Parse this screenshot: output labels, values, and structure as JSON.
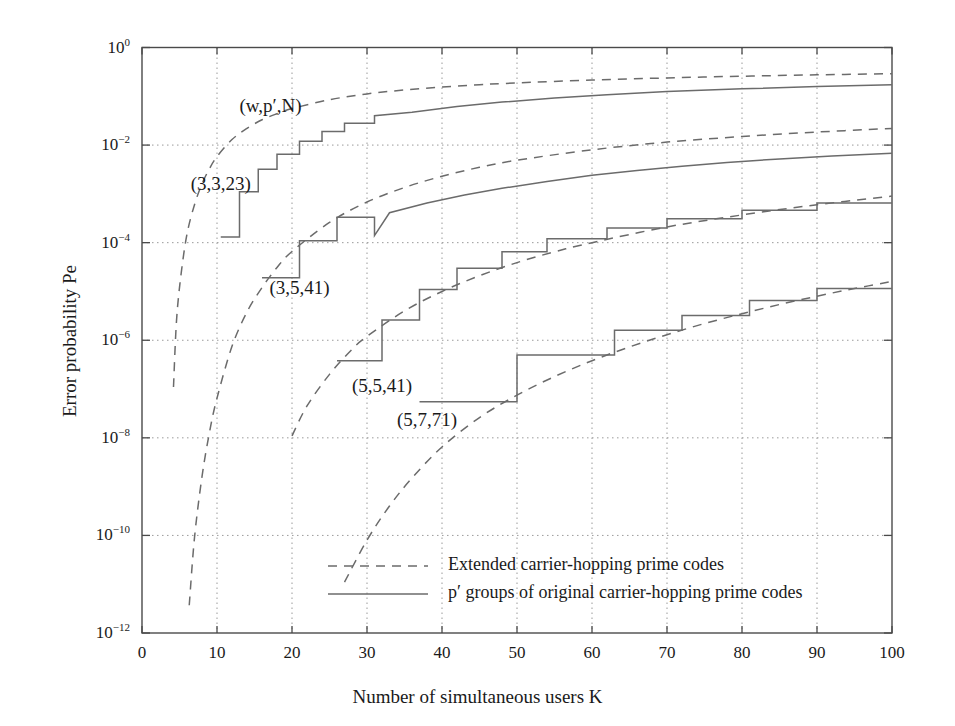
{
  "chart_data": {
    "type": "line",
    "title": "",
    "xlabel": "Number of simultaneous users K",
    "ylabel": "Error probability Pe",
    "xlim": [
      0,
      100
    ],
    "ylim": [
      1e-12,
      1
    ],
    "yscale": "log",
    "xscale": "linear",
    "grid": true,
    "xticks": [
      "0",
      "10",
      "20",
      "30",
      "40",
      "50",
      "60",
      "70",
      "80",
      "90",
      "100"
    ],
    "yticks": [
      "10⁰",
      "10⁻²",
      "10⁻⁴",
      "10⁻⁶",
      "10⁻⁸",
      "10⁻¹⁰",
      "10⁻¹²"
    ],
    "ytick_exponents": [
      "0",
      "-2",
      "-4",
      "-6",
      "-8",
      "-10",
      "-12"
    ],
    "parameter_legend": "(w,p′,N)",
    "legend_position": "lower-center-inside",
    "legend": [
      {
        "label": "Extended carrier-hopping prime codes",
        "style": "dashed"
      },
      {
        "label": "p′ groups of original carrier-hopping prime codes",
        "style": "solid"
      }
    ],
    "annotations": [
      {
        "text": "(w,p′,N)",
        "x": 13,
        "y": 0.06
      },
      {
        "text": "(3,3,23)",
        "x": 6.5,
        "y": 0.0015
      },
      {
        "text": "(3,5,41)",
        "x": 17,
        "y": 1.1e-05
      },
      {
        "text": "(5,5,41)",
        "x": 28,
        "y": 1.1e-07
      },
      {
        "text": "(5,7,71)",
        "x": 34,
        "y": 2.2e-08
      }
    ],
    "series": [
      {
        "name": "(3,3,23) extended",
        "style": "dashed",
        "params": {
          "w": 3,
          "p_prime": 3,
          "N": 23
        },
        "points": [
          [
            4.2,
            1.1e-07
          ],
          [
            4.6,
            2.5e-06
          ],
          [
            5.2,
            2.2e-05
          ],
          [
            6.0,
            0.00015
          ],
          [
            7.0,
            0.0006
          ],
          [
            8.0,
            0.0016
          ],
          [
            9.0,
            0.0033
          ],
          [
            10.0,
            0.0058
          ],
          [
            12.0,
            0.013
          ],
          [
            14.0,
            0.022
          ],
          [
            16.0,
            0.033
          ],
          [
            18.0,
            0.044
          ],
          [
            20.0,
            0.056
          ],
          [
            25.0,
            0.085
          ],
          [
            30.0,
            0.112
          ],
          [
            35.0,
            0.135
          ],
          [
            40.0,
            0.155
          ],
          [
            45.0,
            0.173
          ],
          [
            50.0,
            0.188
          ],
          [
            60.0,
            0.215
          ],
          [
            70.0,
            0.238
          ],
          [
            80.0,
            0.258
          ],
          [
            90.0,
            0.275
          ],
          [
            100.0,
            0.29
          ]
        ]
      },
      {
        "name": "(3,3,23) p′ groups",
        "style": "solid-step",
        "params": {
          "w": 3,
          "p_prime": 3,
          "N": 23
        },
        "points": [
          [
            10.5,
            0.00013
          ],
          [
            13.0,
            0.00013
          ],
          [
            13.0,
            0.0011
          ],
          [
            15.5,
            0.0011
          ],
          [
            15.5,
            0.0032
          ],
          [
            18.0,
            0.0032
          ],
          [
            18.0,
            0.0065
          ],
          [
            21.0,
            0.0065
          ],
          [
            21.0,
            0.012
          ],
          [
            24.0,
            0.012
          ],
          [
            24.0,
            0.019
          ],
          [
            27.0,
            0.019
          ],
          [
            27.0,
            0.028
          ],
          [
            31.0,
            0.028
          ],
          [
            31.0,
            0.04
          ],
          [
            36.0,
            0.047
          ],
          [
            42.0,
            0.062
          ],
          [
            48.0,
            0.076
          ],
          [
            55.0,
            0.092
          ],
          [
            62.0,
            0.108
          ],
          [
            70.0,
            0.125
          ],
          [
            80.0,
            0.142
          ],
          [
            90.0,
            0.158
          ],
          [
            100.0,
            0.172
          ]
        ]
      },
      {
        "name": "(3,5,41) extended",
        "style": "dashed",
        "params": {
          "w": 3,
          "p_prime": 5,
          "N": 41
        },
        "points": [
          [
            6.3,
            3.7e-12
          ],
          [
            7.0,
            9e-11
          ],
          [
            8.0,
            1.6e-09
          ],
          [
            9.0,
            1.3e-08
          ],
          [
            10.0,
            6.5e-08
          ],
          [
            12.0,
            7.5e-07
          ],
          [
            14.0,
            3.8e-06
          ],
          [
            16.0,
            1.2e-05
          ],
          [
            18.0,
            3.1e-05
          ],
          [
            20.0,
            6.6e-05
          ],
          [
            25.0,
            0.00026
          ],
          [
            30.0,
            0.00068
          ],
          [
            35.0,
            0.00135
          ],
          [
            40.0,
            0.0023
          ],
          [
            45.0,
            0.0035
          ],
          [
            50.0,
            0.0049
          ],
          [
            60.0,
            0.008
          ],
          [
            70.0,
            0.0115
          ],
          [
            80.0,
            0.015
          ],
          [
            90.0,
            0.0185
          ],
          [
            100.0,
            0.022
          ]
        ]
      },
      {
        "name": "(3,5,41) p′ groups",
        "style": "solid-step",
        "params": {
          "w": 3,
          "p_prime": 5,
          "N": 41
        },
        "points": [
          [
            16.0,
            1.9e-05
          ],
          [
            21.0,
            1.9e-05
          ],
          [
            21.0,
            0.00011
          ],
          [
            26.0,
            0.00011
          ],
          [
            26.0,
            0.00033
          ],
          [
            31.0,
            0.00033
          ],
          [
            31.0,
            0.00014
          ],
          [
            33.0,
            0.00041
          ],
          [
            38.0,
            0.00065
          ],
          [
            43.0,
            0.00095
          ],
          [
            48.0,
            0.0013
          ],
          [
            54.0,
            0.0018
          ],
          [
            60.0,
            0.0024
          ],
          [
            66.0,
            0.003
          ],
          [
            72.0,
            0.0037
          ],
          [
            78.0,
            0.0044
          ],
          [
            85.0,
            0.0052
          ],
          [
            92.0,
            0.006
          ],
          [
            100.0,
            0.0068
          ]
        ]
      },
      {
        "name": "(5,5,41) extended",
        "style": "dashed",
        "params": {
          "w": 5,
          "p_prime": 5,
          "N": 41
        },
        "points": [
          [
            20.0,
            1.1e-08
          ],
          [
            22.0,
            4.5e-08
          ],
          [
            25.0,
            2e-07
          ],
          [
            28.0,
            6.5e-07
          ],
          [
            30.0,
            1.2e-06
          ],
          [
            35.0,
            4e-06
          ],
          [
            40.0,
            1e-05
          ],
          [
            45.0,
            2.1e-05
          ],
          [
            50.0,
            3.9e-05
          ],
          [
            55.0,
            6.5e-05
          ],
          [
            60.0,
            0.0001
          ],
          [
            70.0,
            0.00021
          ],
          [
            80.0,
            0.00037
          ],
          [
            90.0,
            0.0006
          ],
          [
            100.0,
            0.0009
          ]
        ]
      },
      {
        "name": "(5,5,41) p′ groups",
        "style": "solid-step",
        "params": {
          "w": 5,
          "p_prime": 5,
          "N": 41
        },
        "points": [
          [
            26.0,
            3.8e-07
          ],
          [
            32.0,
            3.8e-07
          ],
          [
            32.0,
            2.6e-06
          ],
          [
            37.0,
            2.6e-06
          ],
          [
            37.0,
            1.1e-05
          ],
          [
            42.0,
            1.1e-05
          ],
          [
            42.0,
            3e-05
          ],
          [
            48.0,
            3e-05
          ],
          [
            48.0,
            6.5e-05
          ],
          [
            54.0,
            6.5e-05
          ],
          [
            54.0,
            0.00012
          ],
          [
            62.0,
            0.00012
          ],
          [
            62.0,
            0.0002
          ],
          [
            70.0,
            0.0002
          ],
          [
            70.0,
            0.00031
          ],
          [
            80.0,
            0.00031
          ],
          [
            80.0,
            0.00046
          ],
          [
            90.0,
            0.00046
          ],
          [
            90.0,
            0.00065
          ],
          [
            100.0,
            0.00065
          ]
        ]
      },
      {
        "name": "(5,7,71) extended",
        "style": "dashed",
        "params": {
          "w": 5,
          "p_prime": 7,
          "N": 71
        },
        "points": [
          [
            27.0,
            1.1e-11
          ],
          [
            30.0,
            8e-11
          ],
          [
            33.0,
            4e-10
          ],
          [
            36.0,
            1.5e-09
          ],
          [
            40.0,
            6.5e-09
          ],
          [
            45.0,
            2.6e-08
          ],
          [
            50.0,
            7.5e-08
          ],
          [
            55.0,
            1.8e-07
          ],
          [
            60.0,
            3.8e-07
          ],
          [
            65.0,
            7.3e-07
          ],
          [
            70.0,
            1.3e-06
          ],
          [
            75.0,
            2.2e-06
          ],
          [
            80.0,
            3.5e-06
          ],
          [
            85.0,
            5.4e-06
          ],
          [
            90.0,
            8e-06
          ],
          [
            95.0,
            1.15e-05
          ],
          [
            100.0,
            1.6e-05
          ]
        ]
      },
      {
        "name": "(5,7,71) p′ groups",
        "style": "solid-step",
        "params": {
          "w": 5,
          "p_prime": 7,
          "N": 71
        },
        "points": [
          [
            37.0,
            5.5e-08
          ],
          [
            50.0,
            5.5e-08
          ],
          [
            50.0,
            5e-07
          ],
          [
            63.0,
            5e-07
          ],
          [
            63.0,
            1.6e-06
          ],
          [
            72.0,
            1.6e-06
          ],
          [
            72.0,
            3.2e-06
          ],
          [
            81.0,
            3.2e-06
          ],
          [
            81.0,
            6.5e-06
          ],
          [
            90.0,
            6.5e-06
          ],
          [
            90.0,
            1.15e-05
          ],
          [
            100.0,
            1.15e-05
          ]
        ]
      }
    ]
  },
  "colors": {
    "axis": "#4a4a4a",
    "grid": "#9a9a9a",
    "curve": "#6b6b6b",
    "text": "#1a1a1a",
    "background": "#ffffff"
  }
}
